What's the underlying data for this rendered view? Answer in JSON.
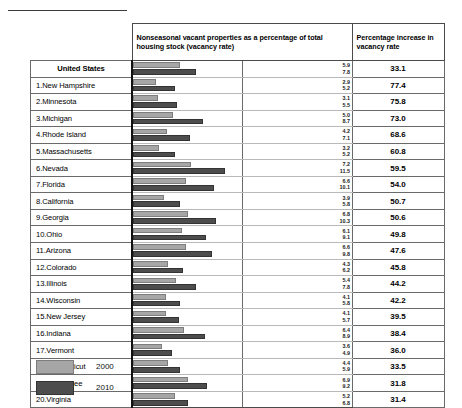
{
  "header": {
    "chart_column": "Nonseasonal vacant properties as a percentage of total housing stock (vacancy rate)",
    "pct_column": "Percentage increase in vacancy rate"
  },
  "legend": {
    "items": [
      {
        "label": "2000",
        "color": "#a6a6a6"
      },
      {
        "label": "2010",
        "color": "#4d4d4d"
      }
    ]
  },
  "chart_data": {
    "type": "bar",
    "title": "Nonseasonal vacant properties as a percentage of total housing stock (vacancy rate)",
    "xlabel": "",
    "ylabel": "",
    "orientation": "horizontal",
    "grid": false,
    "legend_position": "bottom-left",
    "xlim": [
      0,
      13.5
    ],
    "categories": [
      "United States",
      "1.New Hampshire",
      "2.Minnesota",
      "3.Michigan",
      "4.Rhode Island",
      "5.Massachusetts",
      "6.Nevada",
      "7.Florida",
      "8.California",
      "9.Georgia",
      "10.Ohio",
      "11.Arizona",
      "12.Colorado",
      "13.Illinois",
      "14.Wisconsin",
      "15.New Jersey",
      "16.Indiana",
      "17.Vermont",
      "18.Connecticut",
      "19.Tennessee",
      "20.Virginia"
    ],
    "series": [
      {
        "name": "2000",
        "values": [
          5.9,
          2.9,
          3.1,
          5.0,
          4.2,
          3.2,
          7.2,
          6.6,
          3.9,
          6.8,
          6.1,
          6.6,
          4.3,
          5.4,
          4.1,
          4.1,
          6.4,
          3.6,
          4.4,
          6.9,
          5.2
        ]
      },
      {
        "name": "2010",
        "values": [
          7.8,
          5.2,
          5.5,
          8.7,
          7.1,
          5.2,
          11.5,
          10.1,
          5.8,
          10.3,
          9.1,
          9.8,
          6.2,
          7.8,
          5.8,
          5.7,
          8.9,
          4.9,
          5.9,
          9.2,
          6.8
        ]
      }
    ],
    "percentage_increase": [
      33.1,
      77.4,
      75.8,
      73.0,
      68.6,
      60.8,
      59.5,
      54.0,
      50.7,
      50.6,
      49.8,
      47.6,
      45.8,
      44.2,
      42.2,
      39.5,
      38.4,
      36.0,
      33.5,
      31.8,
      31.4
    ]
  },
  "rows": [
    {
      "name": "United States",
      "v2000": "5.9",
      "v2010": "7.8",
      "pct": "33.1"
    },
    {
      "name": "1.New Hampshire",
      "v2000": "2.9",
      "v2010": "5.2",
      "pct": "77.4"
    },
    {
      "name": "2.Minnesota",
      "v2000": "3.1",
      "v2010": "5.5",
      "pct": "75.8"
    },
    {
      "name": "3.Michigan",
      "v2000": "5.0",
      "v2010": "8.7",
      "pct": "73.0"
    },
    {
      "name": "4.Rhode Island",
      "v2000": "4.2",
      "v2010": "7.1",
      "pct": "68.6"
    },
    {
      "name": "5.Massachusetts",
      "v2000": "3.2",
      "v2010": "5.2",
      "pct": "60.8"
    },
    {
      "name": "6.Nevada",
      "v2000": "7.2",
      "v2010": "11.5",
      "pct": "59.5"
    },
    {
      "name": "7.Florida",
      "v2000": "6.6",
      "v2010": "10.1",
      "pct": "54.0"
    },
    {
      "name": "8.California",
      "v2000": "3.9",
      "v2010": "5.8",
      "pct": "50.7"
    },
    {
      "name": "9.Georgia",
      "v2000": "6.8",
      "v2010": "10.3",
      "pct": "50.6"
    },
    {
      "name": "10.Ohio",
      "v2000": "6.1",
      "v2010": "9.1",
      "pct": "49.8"
    },
    {
      "name": "11.Arizona",
      "v2000": "6.6",
      "v2010": "9.8",
      "pct": "47.6"
    },
    {
      "name": "12.Colorado",
      "v2000": "4.3",
      "v2010": "6.2",
      "pct": "45.8"
    },
    {
      "name": "13.Illinois",
      "v2000": "5.4",
      "v2010": "7.8",
      "pct": "44.2"
    },
    {
      "name": "14.Wisconsin",
      "v2000": "4.1",
      "v2010": "5.8",
      "pct": "42.2"
    },
    {
      "name": "15.New Jersey",
      "v2000": "4.1",
      "v2010": "5.7",
      "pct": "39.5"
    },
    {
      "name": "16.Indiana",
      "v2000": "6.4",
      "v2010": "8.9",
      "pct": "38.4"
    },
    {
      "name": "17.Vermont",
      "v2000": "3.6",
      "v2010": "4.9",
      "pct": "36.0"
    },
    {
      "name": "18.Connecticut",
      "v2000": "4.4",
      "v2010": "5.9",
      "pct": "33.5"
    },
    {
      "name": "19.Tennessee",
      "v2000": "6.9",
      "v2010": "9.2",
      "pct": "31.8"
    },
    {
      "name": "20.Virginia",
      "v2000": "5.2",
      "v2010": "6.8",
      "pct": "31.4"
    }
  ]
}
